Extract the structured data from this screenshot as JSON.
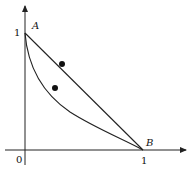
{
  "diagram": {
    "axes": {
      "origin_label": "0",
      "x_tick_label": "1",
      "y_tick_label": "1"
    },
    "points": {
      "A": {
        "label": "A",
        "x": 0,
        "y": 1
      },
      "B": {
        "label": "B",
        "x": 1,
        "y": 0
      }
    },
    "segment_AB": {
      "from": "A",
      "to": "B"
    },
    "curve_AB": {
      "from": "A",
      "to": "B",
      "shape": "convex curve below segment"
    },
    "markers": [
      {
        "on": "segment_AB",
        "x": 0.32,
        "y": 0.68
      },
      {
        "on": "curve_AB",
        "x": 0.26,
        "y": 0.5
      }
    ],
    "colors": {
      "stroke": "#222222",
      "background": "#ffffff"
    }
  }
}
